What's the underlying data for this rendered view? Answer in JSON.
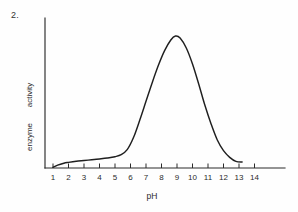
{
  "figure": {
    "number_label": "2.",
    "background_color": "#fefefe",
    "ink_color": "#1f1f1f"
  },
  "chart_data": {
    "type": "line",
    "title": "",
    "subtitle": "",
    "xlabel": "pH",
    "ylabel": "enzyme   activity",
    "ylabel_words": [
      "enzyme",
      "activity"
    ],
    "xlim": [
      0,
      14.8
    ],
    "ylim": [
      0,
      1.08
    ],
    "xticks": [
      1,
      2,
      3,
      4,
      5,
      6,
      7,
      8,
      9,
      10,
      11,
      12,
      13,
      14
    ],
    "xtick_labels": [
      "1",
      "2",
      "3",
      "4",
      "5",
      "6",
      "7",
      "8",
      "9",
      "10",
      "11",
      "12",
      "13",
      "14"
    ],
    "yticks": [],
    "ytick_labels": [],
    "grid": false,
    "legend": false,
    "legend_position": "none",
    "annotations": [],
    "series": [
      {
        "name": "enzyme activity",
        "color": "#1f1f1f",
        "x": [
          1.0,
          1.3,
          1.7,
          2.0,
          2.5,
          3.0,
          3.5,
          4.0,
          4.5,
          5.0,
          5.4,
          5.8,
          6.2,
          6.6,
          7.0,
          7.4,
          7.8,
          8.2,
          8.6,
          8.9,
          9.2,
          9.6,
          10.0,
          10.4,
          10.8,
          11.2,
          11.6,
          12.0,
          12.4,
          12.8,
          13.2
        ],
        "y": [
          0.005,
          0.022,
          0.036,
          0.042,
          0.05,
          0.056,
          0.062,
          0.068,
          0.075,
          0.085,
          0.1,
          0.14,
          0.23,
          0.36,
          0.5,
          0.64,
          0.77,
          0.88,
          0.96,
          0.99,
          0.975,
          0.9,
          0.78,
          0.63,
          0.47,
          0.33,
          0.21,
          0.13,
          0.08,
          0.05,
          0.045
        ]
      }
    ],
    "peak": {
      "x": 8.9,
      "y": 1.0,
      "description": "optimum pH near 9"
    },
    "curve_end_x": 13.2
  },
  "axes": {
    "x_axis_name": "x-axis",
    "y_axis_name": "y-axis",
    "x_axis_start_px": 45,
    "x_axis_end_px": 285,
    "y_axis_top_px": 18,
    "baseline_px": 168,
    "tick_spacing_px": 15.5,
    "first_tick_px": 53
  }
}
